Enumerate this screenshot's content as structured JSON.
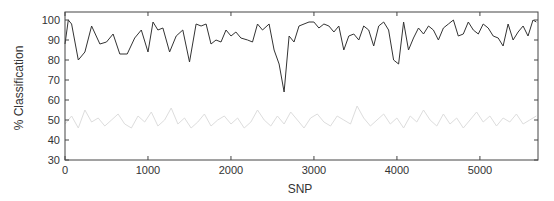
{
  "chart_data": {
    "type": "line",
    "title": "",
    "xlabel": "SNP",
    "ylabel": "% Classification",
    "xlim": [
      0,
      5700
    ],
    "ylim": [
      30,
      104
    ],
    "xticks": [
      0,
      1000,
      2000,
      3000,
      4000,
      5000
    ],
    "yticks": [
      30,
      40,
      50,
      60,
      70,
      80,
      90,
      100
    ],
    "grid": false,
    "legend": null,
    "series": [
      {
        "name": "upper",
        "color": "#333333",
        "x": [
          0,
          40,
          80,
          160,
          240,
          320,
          420,
          500,
          580,
          660,
          750,
          840,
          920,
          1000,
          1060,
          1120,
          1180,
          1260,
          1340,
          1420,
          1500,
          1580,
          1640,
          1700,
          1760,
          1820,
          1880,
          1940,
          2000,
          2060,
          2120,
          2200,
          2260,
          2320,
          2380,
          2460,
          2520,
          2580,
          2640,
          2700,
          2760,
          2820,
          2880,
          2940,
          3000,
          3060,
          3120,
          3180,
          3240,
          3300,
          3360,
          3420,
          3480,
          3540,
          3600,
          3660,
          3720,
          3780,
          3840,
          3900,
          3960,
          4020,
          4080,
          4140,
          4200,
          4260,
          4320,
          4380,
          4440,
          4500,
          4560,
          4620,
          4680,
          4740,
          4800,
          4860,
          4920,
          4980,
          5040,
          5100,
          5160,
          5220,
          5280,
          5340,
          5400,
          5460,
          5520,
          5580,
          5640,
          5680
        ],
        "values": [
          88,
          100,
          98,
          80,
          84,
          97,
          88,
          89,
          93,
          83,
          83,
          91,
          95,
          84,
          99,
          95,
          96,
          84,
          92,
          95,
          79,
          98,
          97,
          98,
          88,
          90,
          89,
          95,
          92,
          94,
          91,
          90,
          89,
          98,
          95,
          98,
          85,
          78,
          64,
          92,
          89,
          97,
          98,
          99,
          99,
          96,
          98,
          97,
          94,
          97,
          85,
          92,
          93,
          90,
          97,
          95,
          87,
          97,
          99,
          95,
          80,
          78,
          99,
          85,
          91,
          96,
          93,
          97,
          95,
          90,
          96,
          98,
          100,
          92,
          93,
          99,
          95,
          93,
          98,
          96,
          92,
          91,
          87,
          98,
          90,
          94,
          97,
          92,
          100,
          99
        ]
      },
      {
        "name": "lower",
        "color": "#dddddd",
        "x": [
          0,
          80,
          160,
          240,
          320,
          400,
          480,
          560,
          640,
          720,
          800,
          880,
          960,
          1040,
          1120,
          1200,
          1280,
          1360,
          1440,
          1520,
          1600,
          1680,
          1760,
          1840,
          1920,
          2000,
          2080,
          2160,
          2240,
          2320,
          2400,
          2480,
          2560,
          2640,
          2720,
          2800,
          2880,
          2960,
          3040,
          3120,
          3200,
          3280,
          3360,
          3440,
          3520,
          3600,
          3680,
          3760,
          3840,
          3920,
          4000,
          4080,
          4160,
          4240,
          4320,
          4400,
          4480,
          4560,
          4640,
          4720,
          4800,
          4880,
          4960,
          5040,
          5120,
          5200,
          5280,
          5360,
          5440,
          5520,
          5600,
          5680
        ],
        "values": [
          48,
          52,
          46,
          55,
          49,
          51,
          47,
          50,
          53,
          48,
          46,
          52,
          49,
          54,
          47,
          50,
          56,
          48,
          51,
          46,
          49,
          53,
          47,
          50,
          52,
          48,
          51,
          46,
          49,
          55,
          50,
          47,
          52,
          48,
          54,
          50,
          46,
          51,
          53,
          49,
          47,
          52,
          50,
          48,
          57,
          51,
          47,
          50,
          53,
          48,
          51,
          46,
          52,
          49,
          55,
          50,
          47,
          53,
          48,
          51,
          46,
          50,
          54,
          49,
          52,
          47,
          51,
          49,
          53,
          48,
          50,
          52
        ]
      }
    ]
  }
}
